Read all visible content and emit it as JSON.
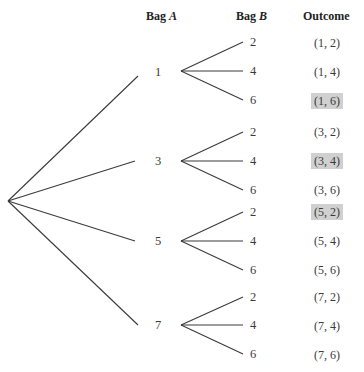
{
  "headers": {
    "bag_a_prefix": "Bag ",
    "bag_a_var": "A",
    "bag_b_prefix": "Bag ",
    "bag_b_var": "B",
    "outcome": "Outcome"
  },
  "colors": {
    "line": "#3a3a3a",
    "highlight": "#d0d0d0"
  },
  "tree": {
    "bag_a": [
      "1",
      "3",
      "5",
      "7"
    ],
    "bag_b": [
      "2",
      "4",
      "6"
    ]
  },
  "outcomes": [
    {
      "text": "(1, 2)",
      "highlight": false
    },
    {
      "text": "(1, 4)",
      "highlight": false
    },
    {
      "text": "(1, 6)",
      "highlight": true
    },
    {
      "text": "(3, 2)",
      "highlight": false
    },
    {
      "text": "(3, 4)",
      "highlight": true
    },
    {
      "text": "(3, 6)",
      "highlight": false
    },
    {
      "text": "(5, 2)",
      "highlight": true
    },
    {
      "text": "(5, 4)",
      "highlight": false
    },
    {
      "text": "(5, 6)",
      "highlight": false
    },
    {
      "text": "(7, 2)",
      "highlight": false
    },
    {
      "text": "(7, 4)",
      "highlight": false
    },
    {
      "text": "(7, 6)",
      "highlight": false
    }
  ]
}
